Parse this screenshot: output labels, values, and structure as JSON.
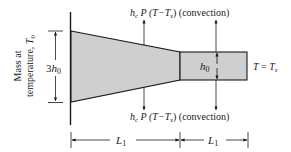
{
  "diagram": {
    "type": "tapered-fin-heat-transfer",
    "left_label_line1": "Mass at",
    "left_label_line2": "temperature, ",
    "left_label_var": "T",
    "left_label_sub": "0",
    "height_left": {
      "coef": "3",
      "var": "h",
      "sub": "0"
    },
    "height_right": {
      "var": "h",
      "sub": "0"
    },
    "convection_top": {
      "h": "h",
      "h_sub": "c",
      "rest": " P (T−T",
      "s_sub": "s",
      "close": ")",
      "note": " (convection)"
    },
    "convection_bottom": {
      "h": "h",
      "h_sub": "c",
      "rest": " P (T−T",
      "s_sub": "s",
      "close": ")",
      "note": " (convection)"
    },
    "tip_condition": {
      "lhs": "T",
      "eq": " = ",
      "rhs": "T",
      "rhs_sub": "s"
    },
    "length_1": {
      "var": "L",
      "sub": "1"
    },
    "length_2": {
      "var": "L",
      "sub": "1"
    },
    "colors": {
      "fill": "#cfcfcf",
      "stroke": "#1a1a1a",
      "text": "#222222"
    }
  }
}
